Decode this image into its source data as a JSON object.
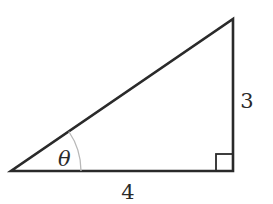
{
  "diagram": {
    "type": "right-triangle",
    "labels": {
      "angle": "θ",
      "adjacent": "4",
      "opposite": "3"
    },
    "colors": {
      "stroke": "#2a2a2a",
      "arc": "#b8b8b8"
    }
  }
}
